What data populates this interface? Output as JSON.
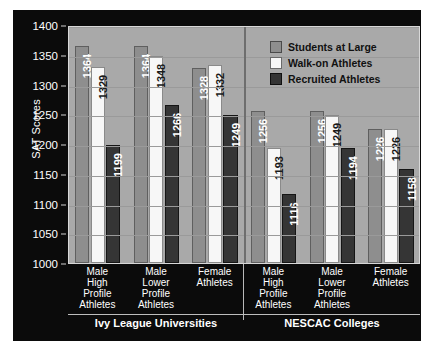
{
  "chart_data": {
    "type": "bar",
    "title": "",
    "xlabel": "",
    "ylabel": "SAT Scores",
    "ylim": [
      1000,
      1400
    ],
    "ytick_step": 50,
    "yticks": [
      1400,
      1350,
      1300,
      1250,
      1200,
      1150,
      1100,
      1050,
      1000
    ],
    "grid": true,
    "legend_position": "top-right",
    "panels": [
      {
        "name": "Ivy League Universities",
        "categories": [
          "Male High Profile Athletes",
          "Male Lower Profile Athletes",
          "Female Athletes"
        ],
        "category_lines": [
          [
            "Male",
            "High",
            "Profile",
            "Athletes"
          ],
          [
            "Male",
            "Lower",
            "Profile",
            "Athletes"
          ],
          [
            "Female",
            "Athletes"
          ]
        ],
        "series": [
          {
            "name": "Students at Large",
            "values": [
              1364,
              1364,
              1328
            ]
          },
          {
            "name": "Walk-on Athletes",
            "values": [
              1329,
              1348,
              1332
            ]
          },
          {
            "name": "Recruited Athletes",
            "values": [
              1199,
              1266,
              1249
            ]
          }
        ]
      },
      {
        "name": "NESCAC Colleges",
        "categories": [
          "Male High Profile Athletes",
          "Male Lower Profile Athletes",
          "Female Athletes"
        ],
        "category_lines": [
          [
            "Male",
            "High",
            "Profile",
            "Athletes"
          ],
          [
            "Male",
            "Lower",
            "Profile",
            "Athletes"
          ],
          [
            "Female",
            "Athletes"
          ]
        ],
        "series": [
          {
            "name": "Students at Large",
            "values": [
              1256,
              1256,
              1226
            ]
          },
          {
            "name": "Walk-on Athletes",
            "values": [
              1193,
              1249,
              1226
            ]
          },
          {
            "name": "Recruited Athletes",
            "values": [
              1116,
              1194,
              1158
            ]
          }
        ]
      }
    ],
    "series_colors": [
      "#8e8e8e",
      "#f7f7f7",
      "#353535"
    ]
  },
  "legend": {
    "items": [
      {
        "label": "Students at Large",
        "swatch": "#8e8e8e"
      },
      {
        "label": "Walk-on Athletes",
        "swatch": "#f7f7f7"
      },
      {
        "label": "Recruited Athletes",
        "swatch": "#353535"
      }
    ]
  },
  "colors": {
    "panel_background": "#0b0b0b",
    "plot_background": "#a9a9a9",
    "gridline": "#9a9a9a",
    "axis_text": "#ffffff"
  }
}
